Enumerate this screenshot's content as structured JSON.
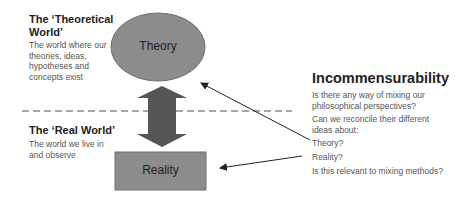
{
  "theoretical_world": {
    "heading_line1": "The ‘Theoretical",
    "heading_line2": "World’",
    "description": [
      "The world where our",
      "theories, ideas,",
      "hypotheses and",
      "concepts exist"
    ]
  },
  "real_world": {
    "heading": "The ‘Real World’",
    "description": [
      "The world we live in",
      "and observe"
    ]
  },
  "nodes": {
    "theory": {
      "label": "Theory",
      "shape": "ellipse",
      "color": "#8c8c8c"
    },
    "reality": {
      "label": "Reality",
      "shape": "rectangle",
      "color": "#8c8c8c"
    }
  },
  "connector": {
    "type": "double-arrow",
    "color": "#555555"
  },
  "divider": {
    "style": "dashed",
    "color": "#888888"
  },
  "incommensurability": {
    "heading": "Incommensurability",
    "question1": [
      "Is there any way of mixing our",
      "philosophical perspectives?"
    ],
    "question2": [
      "Can we reconcile their different",
      "ideas about:"
    ],
    "item_theory": "Theory?",
    "item_reality": "Reality?",
    "question3": "Is this relevant to mixing methods?"
  }
}
